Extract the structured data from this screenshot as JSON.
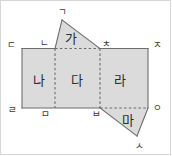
{
  "figure": {
    "background_color": "#ffffff",
    "face_fill_color": "#dbdbdb",
    "edge_color": "#6d6d6d",
    "frame_color": "#d7d7d7",
    "label_color": "#2b2b2b"
  },
  "faces": [
    {
      "id": "ga",
      "label": "가",
      "shape": "triangle",
      "cx": 71,
      "cy": 38,
      "points": "62,20 55,48.5 100,48.5"
    },
    {
      "id": "na",
      "label": "나",
      "shape": "rectangle",
      "cx": 38.5,
      "cy": 80,
      "points": "22,48.5 55,48.5 55,108 22,108"
    },
    {
      "id": "da",
      "label": "다",
      "shape": "rectangle",
      "cx": 77,
      "cy": 80,
      "points": "55,48.5 100,48.5 100,108 55,108"
    },
    {
      "id": "ra",
      "label": "라",
      "shape": "rectangle",
      "cx": 120,
      "cy": 80,
      "points": "100,48.5 148,48.5 148,108 100,108"
    },
    {
      "id": "ma",
      "label": "마",
      "shape": "triangle",
      "cx": 128,
      "cy": 120,
      "points": "100,108 148,108 137,136"
    }
  ],
  "edges": {
    "solid": [
      "M 62,20 L 55,48.5",
      "M 62,20 L 100,48.5",
      "M 22,48.5 L 55,48.5",
      "M 100,48.5 L 148,48.5",
      "M 22,48.5 L 22,108",
      "M 148,48.5 L 148,108",
      "M 22,108 L 100,108",
      "M 100,108 L 137,136",
      "M 148,108 L 137,136"
    ],
    "dashed": [
      "M 55,48.5 L 100,48.5",
      "M 55,48.5 L 55,108",
      "M 100,48.5 L 100,108",
      "M 100,108 L 148,108"
    ]
  },
  "vertices": [
    {
      "id": "giyeok",
      "label": "ㄱ",
      "x": 62,
      "y": 12,
      "anchor": "above-apex"
    },
    {
      "id": "nieun",
      "label": "ㄴ",
      "x": 44,
      "y": 43,
      "anchor": "upper-left"
    },
    {
      "id": "digeut",
      "label": "ㄷ",
      "x": 11,
      "y": 45,
      "anchor": "left"
    },
    {
      "id": "chieut",
      "label": "ㅊ",
      "x": 106,
      "y": 43.5,
      "anchor": "upper-right"
    },
    {
      "id": "jieut",
      "label": "ㅈ",
      "x": 157,
      "y": 45,
      "anchor": "right"
    },
    {
      "id": "rieul",
      "label": "ㄹ",
      "x": 12,
      "y": 110,
      "anchor": "lower-left"
    },
    {
      "id": "mieum",
      "label": "ㅁ",
      "x": 45,
      "y": 114,
      "anchor": "below"
    },
    {
      "id": "bieup",
      "label": "ㅂ",
      "x": 96,
      "y": 114,
      "anchor": "below"
    },
    {
      "id": "ieung",
      "label": "ㅇ",
      "x": 157,
      "y": 108,
      "anchor": "right"
    },
    {
      "id": "siot",
      "label": "ㅅ",
      "x": 139,
      "y": 146,
      "anchor": "below-apex"
    }
  ]
}
